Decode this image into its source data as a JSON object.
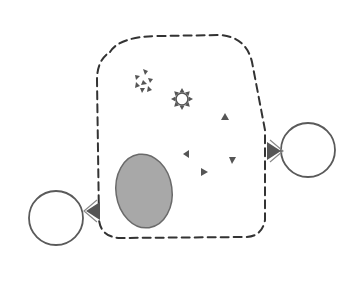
{
  "diagram": {
    "type": "schematic",
    "title": "",
    "colors": {
      "background": "#ffffff",
      "stroke": "#444444",
      "dash_stroke": "#333333",
      "fill_gray": "#a8a8a8",
      "oval_stroke": "#6a6a6a",
      "marker_fill": "#555555",
      "circle_stroke": "#5a5a5a"
    },
    "container": {
      "shape": "dashed-rounded-rectangle",
      "x": 97,
      "y": 34,
      "width": 170,
      "height": 204
    },
    "oval": {
      "cx": 144,
      "cy": 191,
      "rx": 28,
      "ry": 37,
      "label": ""
    },
    "external_circles": [
      {
        "id": "right",
        "cx": 308,
        "cy": 150,
        "r": 27
      },
      {
        "id": "left",
        "cx": 56,
        "cy": 218,
        "r": 27
      }
    ],
    "connectors": [
      {
        "id": "right-receptor",
        "x": 268,
        "y": 150,
        "direction": "right"
      },
      {
        "id": "left-receptor",
        "x": 99,
        "y": 210,
        "direction": "left"
      }
    ],
    "clusters": [
      {
        "id": "scattered-triangle-cluster",
        "cx": 144,
        "cy": 81,
        "count": 7
      },
      {
        "id": "triangle-ring-cluster",
        "cx": 182,
        "cy": 99,
        "count": 8,
        "radius": 10
      }
    ],
    "free_triangles": [
      {
        "x": 225,
        "y": 117,
        "dir": "up"
      },
      {
        "x": 186,
        "y": 154,
        "dir": "left"
      },
      {
        "x": 232,
        "y": 160,
        "dir": "down"
      },
      {
        "x": 204,
        "y": 172,
        "dir": "right"
      }
    ],
    "labels": []
  }
}
